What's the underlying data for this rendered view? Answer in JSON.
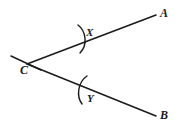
{
  "figure": {
    "type": "geometry-diagram",
    "background_color": "#ffffff",
    "stroke_color": "#1a1a1a",
    "labels": {
      "vertex": "C",
      "ray_upper_endpoint": "A",
      "ray_lower_endpoint": "B",
      "mark_upper": "X",
      "mark_lower": "Y"
    },
    "points": {
      "C": {
        "x": 27,
        "y": 64
      },
      "A": {
        "x": 156,
        "y": 15
      },
      "B": {
        "x": 156,
        "y": 116
      },
      "X_mark": {
        "x": 82,
        "y": 39
      },
      "Y_mark": {
        "x": 83,
        "y": 90
      }
    },
    "strokes": {
      "ray_width": 1.5,
      "mark_width": 1.4,
      "tick_width": 1.4
    }
  }
}
